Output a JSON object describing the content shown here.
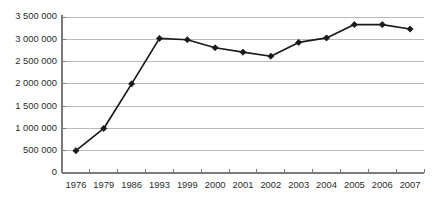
{
  "chart_data": {
    "type": "line",
    "title": "",
    "subtitle": "",
    "xlabel": "",
    "ylabel": "",
    "categories": [
      "1976",
      "1979",
      "1986",
      "1993",
      "1999",
      "2000",
      "2001",
      "2002",
      "2003",
      "2004",
      "2005",
      "2006",
      "2007"
    ],
    "values": [
      500000,
      1000000,
      2000000,
      3020000,
      2990000,
      2810000,
      2710000,
      2620000,
      2930000,
      3030000,
      3330000,
      3330000,
      3230000
    ],
    "series": [
      {
        "name": "",
        "values": [
          500000,
          1000000,
          2000000,
          3020000,
          2990000,
          2810000,
          2710000,
          2620000,
          2930000,
          3030000,
          3330000,
          3330000,
          3230000
        ]
      }
    ],
    "ylim": [
      0,
      3500000
    ],
    "y_ticks": [
      0,
      500000,
      1000000,
      1500000,
      2000000,
      2500000,
      3000000,
      3500000
    ],
    "y_tick_labels": [
      "0",
      "500 000",
      "1 000 000",
      "1 500 000",
      "2 000 000",
      "2 500 000",
      "3 000 000",
      "3 500 000"
    ],
    "grid": true,
    "grid_axis": "y",
    "legend": false,
    "legend_position": "none",
    "marker": "diamond",
    "annotations": []
  },
  "style": {
    "line_color": "#1a1a1a",
    "marker_color": "#1a1a1a",
    "gridline_color": "#b3b3b3",
    "axis_color": "#7a7a7a",
    "text_color": "#2b2b2b",
    "background_color": "#ffffff"
  },
  "layout": {
    "plot_left": 62,
    "plot_right": 424,
    "plot_top": 17,
    "plot_bottom": 173
  }
}
